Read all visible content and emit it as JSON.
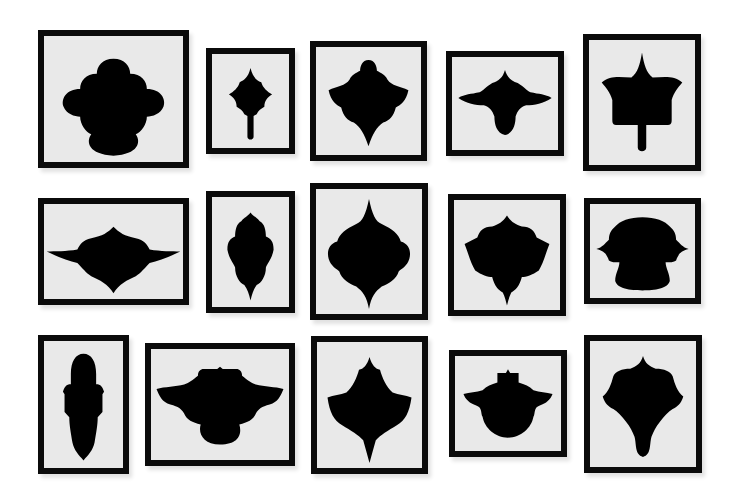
{
  "scene": {
    "description": "Gallery wall of fifteen black-framed artworks, each a symmetric black silhouette on a light mat",
    "background_color": "#ffffff",
    "frame_color": "#0b0b0b",
    "mat_color": "#e9e9e9",
    "silhouette_color": "#000000"
  },
  "frames": [
    {
      "id": 1,
      "row": 1,
      "col": 1,
      "x": 38,
      "y": 30,
      "w": 151,
      "h": 138,
      "shape": "cloud-dome"
    },
    {
      "id": 2,
      "row": 1,
      "col": 2,
      "x": 206,
      "y": 48,
      "w": 89,
      "h": 106,
      "shape": "spiked-stem"
    },
    {
      "id": 3,
      "row": 1,
      "col": 3,
      "x": 310,
      "y": 41,
      "w": 117,
      "h": 120,
      "shape": "diamond-knob"
    },
    {
      "id": 4,
      "row": 1,
      "col": 4,
      "x": 446,
      "y": 51,
      "w": 118,
      "h": 105,
      "shape": "winged-drop"
    },
    {
      "id": 5,
      "row": 1,
      "col": 5,
      "x": 583,
      "y": 34,
      "w": 118,
      "h": 137,
      "shape": "bell-stem"
    },
    {
      "id": 6,
      "row": 2,
      "col": 1,
      "x": 38,
      "y": 198,
      "w": 151,
      "h": 107,
      "shape": "wide-wings"
    },
    {
      "id": 7,
      "row": 2,
      "col": 2,
      "x": 206,
      "y": 191,
      "w": 89,
      "h": 122,
      "shape": "tall-lobed"
    },
    {
      "id": 8,
      "row": 2,
      "col": 3,
      "x": 310,
      "y": 183,
      "w": 118,
      "h": 137,
      "shape": "spire-lobes"
    },
    {
      "id": 9,
      "row": 2,
      "col": 4,
      "x": 448,
      "y": 194,
      "w": 118,
      "h": 122,
      "shape": "star-shield"
    },
    {
      "id": 10,
      "row": 2,
      "col": 5,
      "x": 584,
      "y": 198,
      "w": 117,
      "h": 106,
      "shape": "mushroom"
    },
    {
      "id": 11,
      "row": 3,
      "col": 1,
      "x": 38,
      "y": 335,
      "w": 91,
      "h": 139,
      "shape": "totem"
    },
    {
      "id": 12,
      "row": 3,
      "col": 2,
      "x": 145,
      "y": 343,
      "w": 150,
      "h": 123,
      "shape": "crown-bowl"
    },
    {
      "id": 13,
      "row": 3,
      "col": 3,
      "x": 311,
      "y": 336,
      "w": 117,
      "h": 138,
      "shape": "leaf-spade"
    },
    {
      "id": 14,
      "row": 3,
      "col": 4,
      "x": 449,
      "y": 350,
      "w": 118,
      "h": 107,
      "shape": "lidded-pot"
    },
    {
      "id": 15,
      "row": 3,
      "col": 5,
      "x": 584,
      "y": 335,
      "w": 118,
      "h": 138,
      "shape": "tulip-drip"
    }
  ]
}
